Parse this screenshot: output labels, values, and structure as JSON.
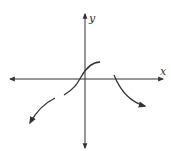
{
  "figure": {
    "type": "function-graph-sketch",
    "axes": {
      "x_label": "x",
      "y_label": "y",
      "color": "#333333"
    },
    "curves": [
      {
        "name": "left-branch",
        "description": "decreasing to the lower-left with arrow, open end near x-axis left of origin"
      },
      {
        "name": "middle-branch",
        "description": "S-shaped increasing curve passing through origin, ending at local plateau above x-axis"
      },
      {
        "name": "right-branch",
        "description": "starts at x-axis right of origin, decreasing to lower-right with arrow"
      }
    ]
  }
}
